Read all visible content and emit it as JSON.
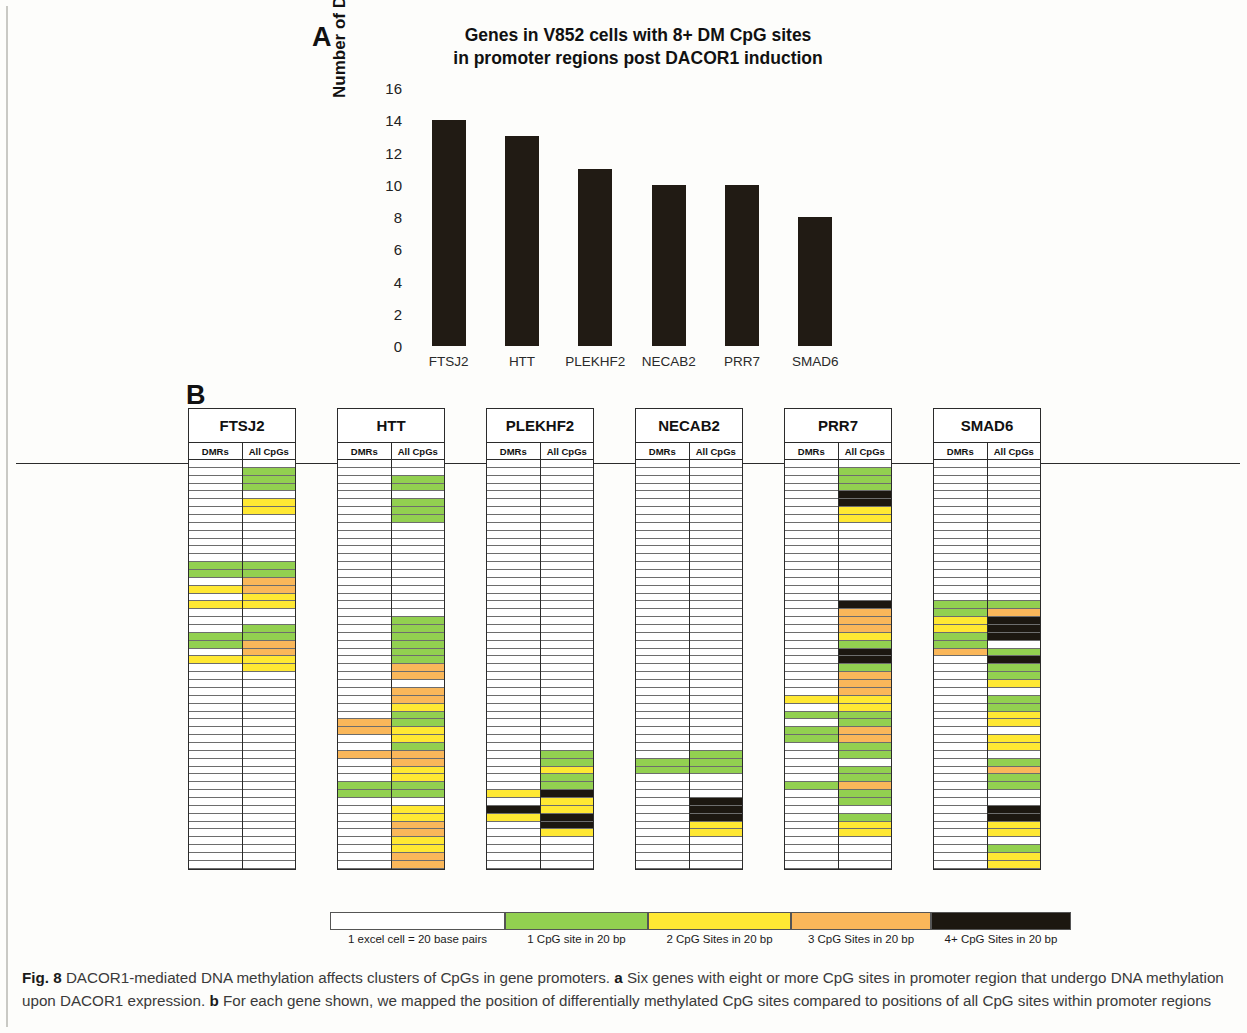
{
  "figure": {
    "panel_a_letter": "A",
    "panel_b_letter": "B",
    "caption_label": "Fig. 8",
    "caption_text_1": " DACOR1-mediated DNA methylation affects clusters of CpGs in gene promoters. ",
    "caption_a_marker": "a",
    "caption_text_2": " Six genes with eight or more CpG sites in promoter region that undergo DNA methylation upon DACOR1 expression. ",
    "caption_b_marker": "b",
    "caption_text_3": " For each gene shown, we mapped the position of differentially methylated CpG sites compared to positions of all CpG sites within promoter regions"
  },
  "chart_data": {
    "type": "bar",
    "title": "Genes in V852 cells with 8+ DM CpG sites in promoter regions post DACOR1 induction",
    "title_line_1": "Genes in V852 cells with 8+ DM CpG sites",
    "title_line_2": "in promoter regions post DACOR1 induction",
    "xlabel": "",
    "ylabel": "Number of DM CpG Sites",
    "categories": [
      "FTSJ2",
      "HTT",
      "PLEKHF2",
      "NECAB2",
      "PRR7",
      "SMAD6"
    ],
    "values": [
      14,
      13,
      11,
      10,
      10,
      8
    ],
    "ylim": [
      0,
      16
    ],
    "yticks": [
      0,
      2,
      4,
      6,
      8,
      10,
      12,
      14,
      16
    ],
    "grid": false,
    "legend": false,
    "bar_color": "#211b14"
  },
  "panel_b": {
    "subcolumn_labels": [
      "DMRs",
      "All CpGs"
    ],
    "genes": [
      "FTSJ2",
      "HTT",
      "PLEKHF2",
      "NECAB2",
      "PRR7",
      "SMAD6"
    ],
    "row_count": 52,
    "colors": {
      "empty": "#ffffff",
      "one_cpg": "#92d050",
      "two_cpg": "#ffe833",
      "three_cpg": "#fab75a",
      "four_plus_cpg": "#1c1710"
    },
    "tracks": {
      "FTSJ2": {
        "DMRs": [
          0,
          0,
          0,
          0,
          0,
          0,
          0,
          0,
          0,
          0,
          0,
          0,
          0,
          1,
          1,
          0,
          2,
          0,
          2,
          0,
          0,
          0,
          1,
          1,
          0,
          2,
          0,
          0,
          0,
          0,
          0,
          0,
          0,
          0,
          0,
          0,
          0,
          0,
          0,
          0,
          0,
          0,
          0,
          0,
          0,
          0,
          0,
          0,
          0,
          0,
          0,
          0
        ],
        "All CpGs": [
          0,
          1,
          1,
          1,
          0,
          2,
          2,
          0,
          0,
          0,
          0,
          0,
          0,
          1,
          1,
          3,
          3,
          2,
          2,
          0,
          0,
          1,
          1,
          3,
          3,
          2,
          2,
          0,
          0,
          0,
          0,
          0,
          0,
          0,
          0,
          0,
          0,
          0,
          0,
          0,
          0,
          0,
          0,
          0,
          0,
          0,
          0,
          0,
          0,
          0,
          0,
          0
        ]
      },
      "HTT": {
        "DMRs": [
          0,
          0,
          0,
          0,
          0,
          0,
          0,
          0,
          0,
          0,
          0,
          0,
          0,
          0,
          0,
          0,
          0,
          0,
          0,
          0,
          0,
          0,
          0,
          0,
          0,
          0,
          0,
          0,
          0,
          0,
          0,
          0,
          0,
          3,
          3,
          0,
          0,
          3,
          0,
          0,
          0,
          1,
          1,
          0,
          0,
          0,
          0,
          0,
          0,
          0,
          0,
          0
        ],
        "All CpGs": [
          0,
          0,
          1,
          1,
          0,
          1,
          1,
          1,
          0,
          0,
          0,
          0,
          0,
          0,
          0,
          0,
          0,
          0,
          0,
          0,
          1,
          1,
          1,
          1,
          1,
          1,
          3,
          3,
          0,
          3,
          3,
          2,
          1,
          1,
          2,
          2,
          1,
          3,
          3,
          2,
          2,
          1,
          1,
          0,
          2,
          2,
          3,
          3,
          2,
          2,
          3,
          3
        ]
      },
      "PLEKHF2": {
        "DMRs": [
          0,
          0,
          0,
          0,
          0,
          0,
          0,
          0,
          0,
          0,
          0,
          0,
          0,
          0,
          0,
          0,
          0,
          0,
          0,
          0,
          0,
          0,
          0,
          0,
          0,
          0,
          0,
          0,
          0,
          0,
          0,
          0,
          0,
          0,
          0,
          0,
          0,
          0,
          0,
          0,
          0,
          0,
          2,
          0,
          4,
          2,
          0,
          0,
          0,
          0,
          0,
          0
        ],
        "All CpGs": [
          0,
          0,
          0,
          0,
          0,
          0,
          0,
          0,
          0,
          0,
          0,
          0,
          0,
          0,
          0,
          0,
          0,
          0,
          0,
          0,
          0,
          0,
          0,
          0,
          0,
          0,
          0,
          0,
          0,
          0,
          0,
          0,
          0,
          0,
          0,
          0,
          0,
          1,
          1,
          2,
          1,
          1,
          4,
          2,
          2,
          4,
          4,
          2,
          0,
          0,
          0,
          0
        ]
      },
      "NECAB2": {
        "DMRs": [
          0,
          0,
          0,
          0,
          0,
          0,
          0,
          0,
          0,
          0,
          0,
          0,
          0,
          0,
          0,
          0,
          0,
          0,
          0,
          0,
          0,
          0,
          0,
          0,
          0,
          0,
          0,
          0,
          0,
          0,
          0,
          0,
          0,
          0,
          0,
          0,
          0,
          0,
          1,
          1,
          0,
          0,
          0,
          0,
          0,
          0,
          0,
          0,
          0,
          0,
          0,
          0
        ],
        "All CpGs": [
          0,
          0,
          0,
          0,
          0,
          0,
          0,
          0,
          0,
          0,
          0,
          0,
          0,
          0,
          0,
          0,
          0,
          0,
          0,
          0,
          0,
          0,
          0,
          0,
          0,
          0,
          0,
          0,
          0,
          0,
          0,
          0,
          0,
          0,
          0,
          0,
          0,
          1,
          1,
          1,
          0,
          0,
          0,
          4,
          4,
          4,
          2,
          2,
          0,
          0,
          0,
          0
        ]
      },
      "PRR7": {
        "DMRs": [
          0,
          0,
          0,
          0,
          0,
          0,
          0,
          0,
          0,
          0,
          0,
          0,
          0,
          0,
          0,
          0,
          0,
          0,
          0,
          0,
          0,
          0,
          0,
          0,
          0,
          0,
          0,
          0,
          0,
          0,
          2,
          0,
          1,
          0,
          1,
          1,
          0,
          0,
          0,
          0,
          0,
          1,
          0,
          0,
          0,
          0,
          0,
          0,
          0,
          0,
          0,
          0
        ],
        "All CpGs": [
          0,
          1,
          1,
          1,
          4,
          4,
          2,
          2,
          0,
          0,
          0,
          0,
          0,
          0,
          0,
          0,
          0,
          0,
          4,
          3,
          3,
          3,
          2,
          1,
          4,
          4,
          1,
          3,
          3,
          3,
          2,
          2,
          1,
          1,
          3,
          3,
          1,
          1,
          0,
          1,
          1,
          3,
          1,
          1,
          0,
          1,
          2,
          2,
          0,
          0,
          0,
          0
        ]
      },
      "SMAD6": {
        "DMRs": [
          0,
          0,
          0,
          0,
          0,
          0,
          0,
          0,
          0,
          0,
          0,
          0,
          0,
          0,
          0,
          0,
          0,
          0,
          1,
          1,
          2,
          2,
          1,
          1,
          3,
          0,
          0,
          0,
          0,
          0,
          0,
          0,
          0,
          0,
          0,
          0,
          0,
          0,
          0,
          0,
          0,
          0,
          0,
          0,
          0,
          0,
          0,
          0,
          0,
          0,
          0,
          0
        ],
        "All CpGs": [
          0,
          0,
          0,
          0,
          0,
          0,
          0,
          0,
          0,
          0,
          0,
          0,
          0,
          0,
          0,
          0,
          0,
          0,
          1,
          3,
          4,
          4,
          4,
          0,
          1,
          4,
          1,
          1,
          2,
          0,
          1,
          1,
          2,
          2,
          0,
          2,
          2,
          0,
          1,
          3,
          1,
          1,
          0,
          0,
          4,
          4,
          2,
          2,
          0,
          1,
          2,
          2
        ]
      }
    }
  },
  "legend": {
    "items": [
      {
        "color": "#ffffff",
        "label": "1 excel cell = 20 base pairs",
        "width": 175
      },
      {
        "color": "#92d050",
        "label": "1 CpG site in 20 bp",
        "width": 143
      },
      {
        "color": "#ffe833",
        "label": "2 CpG Sites in 20 bp",
        "width": 143
      },
      {
        "color": "#fab75a",
        "label": "3 CpG Sites in 20 bp",
        "width": 140
      },
      {
        "color": "#1c1710",
        "label": "4+ CpG Sites in 20 bp",
        "width": 140
      }
    ]
  }
}
